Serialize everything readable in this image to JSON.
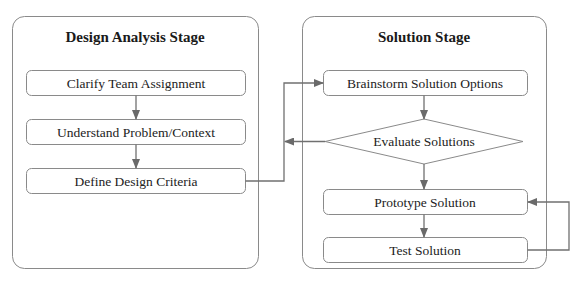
{
  "diagram": {
    "type": "flowchart",
    "colors": {
      "frame_stroke": "#8a8a8a",
      "connector": "#707070",
      "text": "#222222",
      "background": "#ffffff"
    },
    "stages": [
      {
        "id": "design-analysis",
        "title": "Design Analysis Stage",
        "steps": [
          {
            "id": "clarify",
            "label": "Clarify Team Assignment",
            "shape": "rounded-rect"
          },
          {
            "id": "understand",
            "label": "Understand Problem/Context",
            "shape": "rounded-rect"
          },
          {
            "id": "define",
            "label": "Define Design Criteria",
            "shape": "rounded-rect"
          }
        ]
      },
      {
        "id": "solution",
        "title": "Solution Stage",
        "steps": [
          {
            "id": "brainstorm",
            "label": "Brainstorm Solution Options",
            "shape": "rounded-rect"
          },
          {
            "id": "evaluate",
            "label": "Evaluate Solutions",
            "shape": "diamond"
          },
          {
            "id": "prototype",
            "label": "Prototype Solution",
            "shape": "rounded-rect"
          },
          {
            "id": "test",
            "label": "Test Solution",
            "shape": "rounded-rect"
          }
        ]
      }
    ],
    "edges": [
      {
        "from": "clarify",
        "to": "understand"
      },
      {
        "from": "understand",
        "to": "define"
      },
      {
        "from": "define",
        "to": "brainstorm"
      },
      {
        "from": "brainstorm",
        "to": "evaluate"
      },
      {
        "from": "evaluate",
        "to": "define-to-brainstorm-line",
        "note": "loop back"
      },
      {
        "from": "evaluate",
        "to": "prototype"
      },
      {
        "from": "prototype",
        "to": "test"
      },
      {
        "from": "test",
        "to": "prototype",
        "note": "iteration loop"
      }
    ]
  }
}
